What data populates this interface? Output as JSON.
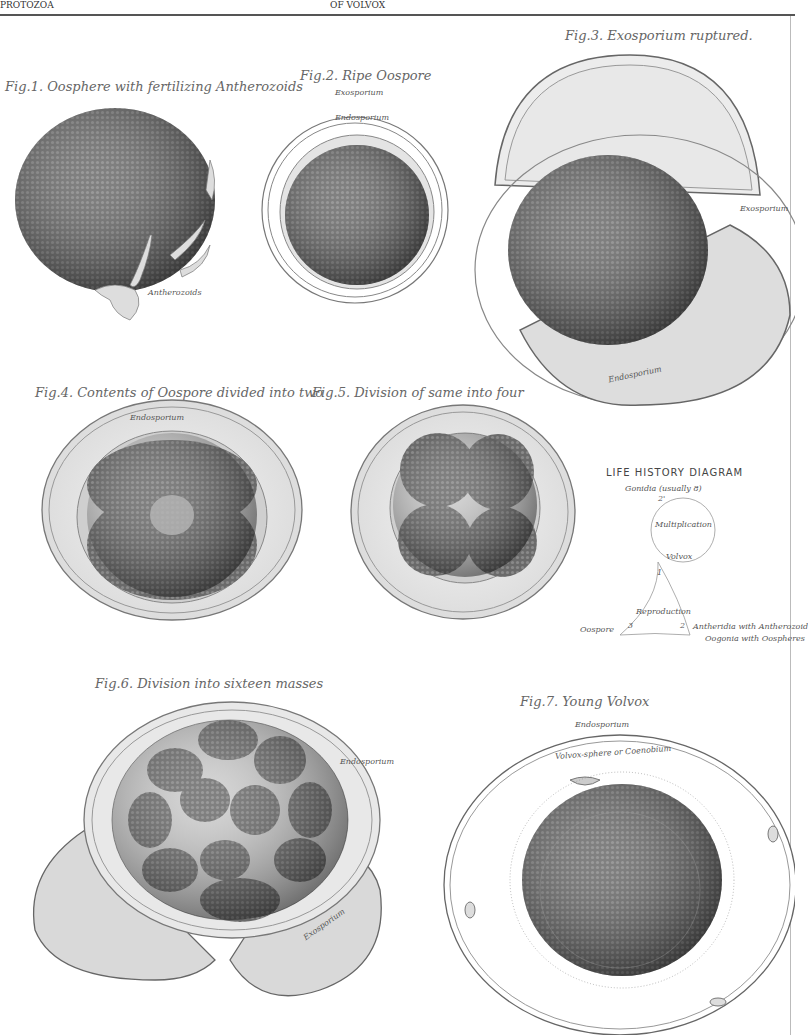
{
  "header": {
    "left": "PROTOZOA",
    "center": "OF VOLVOX"
  },
  "figures": [
    {
      "id": "fig1",
      "caption": "Fig.1. Oosphere with fertilizing Antherozoids",
      "labels": [
        "Antherozoids"
      ]
    },
    {
      "id": "fig2",
      "caption": "Fig.2. Ripe Oospore",
      "labels": [
        "Exosporium",
        "Endosporium"
      ]
    },
    {
      "id": "fig3",
      "caption": "Fig.3. Exosporium ruptured.",
      "labels": [
        "Exosporium",
        "Endosporium"
      ]
    },
    {
      "id": "fig4",
      "caption": "Fig.4. Contents of Oospore divided into two",
      "labels": [
        "Endosporium"
      ]
    },
    {
      "id": "fig5",
      "caption": "Fig.5. Division of same into four",
      "labels": []
    },
    {
      "id": "fig6",
      "caption": "Fig.6. Division into sixteen masses",
      "labels": [
        "Endosporium",
        "Exosporium"
      ]
    },
    {
      "id": "fig7",
      "caption": "Fig.7. Young Volvox",
      "labels": [
        "Endosporium",
        "Volvox-sphere or Coenobium"
      ]
    }
  ],
  "life_history": {
    "title": "LIFE HISTORY DIAGRAM",
    "gonidia": "Gonidia (usually 8)",
    "circle_top_num": "2'",
    "multiplication": "Multiplication",
    "volvox": "Volvox",
    "num1": "1",
    "reproduction": "Reproduction",
    "num3": "3",
    "num2": "2",
    "oospore": "Oospore",
    "antheridia": "Antheridia with Antherozoid",
    "oogonia": "Oogonia with Oospheres"
  }
}
